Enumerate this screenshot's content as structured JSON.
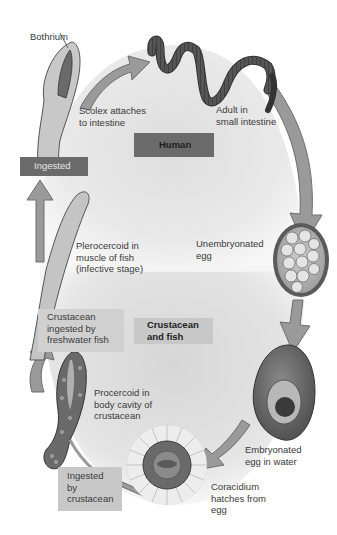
{
  "diagram": {
    "palette": {
      "background_top": "#e6e6e6",
      "background_bottom": "#dcdcdc",
      "arrow_fill": "#9a9a9a",
      "arrow_stroke": "#6e6e6e",
      "dark_box": "#6b6b6b",
      "light_box": "#cfcfcf",
      "worm": "#4a4a4a"
    },
    "hosts": {
      "human": "Human",
      "crustacean_fish": "Crustacean\nand fish"
    },
    "labels": {
      "bothrium": "Bothrium",
      "scolex": "Scolex attaches\nto intestine",
      "adult": "Adult in\nsmall intestine",
      "unembryonated": "Unembryonated\negg",
      "embryonated": "Embryonated\negg in water",
      "coracidium": "Coracidium\nhatches from\negg",
      "ingested_by_crustacean": "Ingested\nby\ncrustacean",
      "procercoid": "Procercoid in\nbody cavity of\ncrustacean",
      "crustacean_ingested": "Crustacean\ningested by\nfreshwater fish",
      "plerocercoid": "Plerocercoid in\nmuscle of fish\n(infective stage)",
      "ingested": "Ingested"
    },
    "stages": [
      "Scolex attaches to intestine",
      "Adult in small intestine",
      "Unembryonated egg",
      "Embryonated egg in water",
      "Coracidium hatches from egg",
      "Ingested by crustacean",
      "Procercoid in body cavity of crustacean",
      "Crustacean ingested by freshwater fish",
      "Plerocercoid in muscle of fish (infective stage)",
      "Ingested"
    ]
  }
}
